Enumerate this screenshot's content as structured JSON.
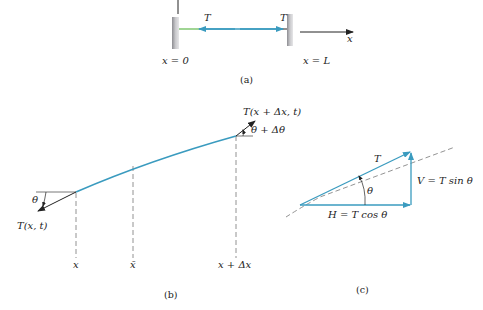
{
  "figure": {
    "panel_a": {
      "tension_left_label": "T",
      "tension_right_label": "T",
      "axis_label": "x",
      "left_end_label": "x = 0",
      "right_end_label": "x = L",
      "caption": "(a)"
    },
    "panel_b": {
      "left_tension_label": "T(x, t)",
      "left_angle_label": "θ",
      "right_tension_label": "T(x + Δx, t)",
      "right_angle_label": "θ + Δθ",
      "x_labels": [
        "x",
        "x̄",
        "x + Δx"
      ],
      "caption": "(b)"
    },
    "panel_c": {
      "tension_label": "T",
      "angle_label": "θ",
      "vertical_label": "V = T sin θ",
      "horizontal_label": "H = T cos θ",
      "caption": "(c)"
    },
    "colors": {
      "string_blue": "#3a9bbf",
      "string_green": "#6cbf5a",
      "wall_gray": "#a8a8ac",
      "ink": "#222222",
      "dash": "#777777"
    }
  }
}
